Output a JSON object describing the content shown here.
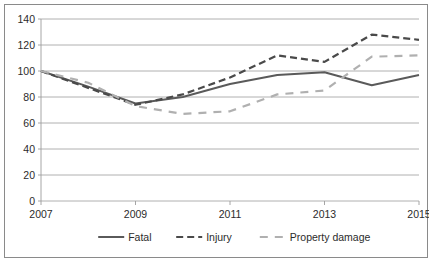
{
  "chart_data": {
    "type": "line",
    "title": "",
    "xlabel": "",
    "ylabel": "",
    "x": [
      2007,
      2008,
      2009,
      2010,
      2011,
      2012,
      2013,
      2014,
      2015
    ],
    "xtick_labels": [
      "2007",
      "2009",
      "2011",
      "2013",
      "2015"
    ],
    "xtick_values": [
      2007,
      2009,
      2011,
      2013,
      2015
    ],
    "ylim": [
      0,
      140
    ],
    "ytick_labels": [
      "0",
      "20",
      "40",
      "60",
      "80",
      "100",
      "120",
      "140"
    ],
    "ytick_values": [
      0,
      20,
      40,
      60,
      80,
      100,
      120,
      140
    ],
    "grid": true,
    "legend_position": "bottom",
    "series": [
      {
        "name": "Fatal",
        "style": "solid",
        "color": "#5a5a5a",
        "values": [
          100,
          88,
          75,
          80,
          90,
          97,
          99,
          89,
          97
        ]
      },
      {
        "name": "Injury",
        "style": "dashed",
        "color": "#4a4a4a",
        "values": [
          100,
          87,
          74,
          82,
          95,
          112,
          107,
          128,
          124
        ]
      },
      {
        "name": "Property damage",
        "style": "dashed",
        "color": "#b0b0b0",
        "values": [
          100,
          91,
          73,
          67,
          69,
          82,
          85,
          111,
          112
        ]
      }
    ]
  },
  "legend": {
    "items": [
      {
        "label": "Fatal"
      },
      {
        "label": "Injury"
      },
      {
        "label": "Property damage"
      }
    ]
  },
  "colors": {
    "fatal": "#5a5a5a",
    "injury": "#4a4a4a",
    "property_damage": "#b0b0b0",
    "grid": "#9c9c9c",
    "border": "#8a8a8a",
    "text": "#2b2b2b",
    "background": "#ffffff"
  }
}
